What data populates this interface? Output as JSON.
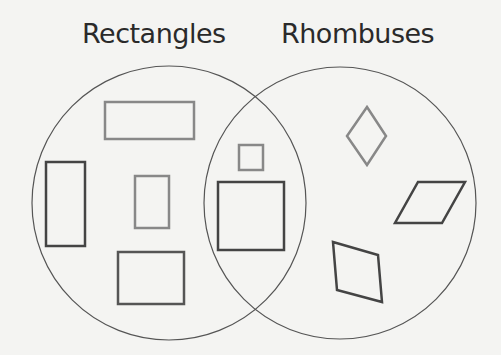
{
  "diagram": {
    "type": "venn",
    "sets": [
      {
        "label": "Rectangles"
      },
      {
        "label": "Rhombuses"
      }
    ],
    "regions": {
      "rectangles_only": [
        "rectangle",
        "rectangle",
        "rectangle",
        "rectangle"
      ],
      "intersection": [
        "square",
        "square"
      ],
      "rhombuses_only": [
        "rhombus",
        "rhombus",
        "rhombus"
      ]
    },
    "colors": {
      "background": "#f4f4f2",
      "circle_stroke": "#555555",
      "shape_dark": "#444444",
      "shape_gray": "#888888"
    }
  }
}
